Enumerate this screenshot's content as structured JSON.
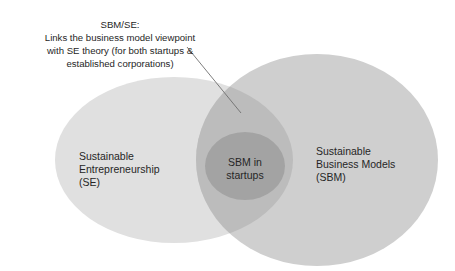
{
  "callout": {
    "title": "SBM/SE:",
    "lines": [
      "Links the business model viewpoint",
      "with SE theory (for both startups &",
      "established corporations)"
    ]
  },
  "circles": {
    "left": {
      "lines": [
        "Sustainable",
        "Entrepreneurship",
        "(SE)"
      ],
      "color": "#e0e0e0"
    },
    "right": {
      "lines": [
        "Sustainable",
        "Business Models",
        "(SBM)"
      ],
      "color": "#cfcfcf"
    },
    "overlap": {
      "color": "#bcbcbc"
    },
    "inner": {
      "lines": [
        "SBM in",
        "startups"
      ],
      "color": "#a3a3a3"
    }
  },
  "pointer_line_color": "#6f6f6f",
  "text_color": "#262626"
}
